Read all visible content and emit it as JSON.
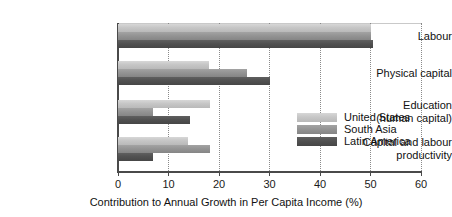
{
  "chart_data": {
    "type": "bar",
    "orientation": "horizontal",
    "title": "",
    "xlabel": "Contribution to Annual Growth in Per Capita Income (%)",
    "ylabel": "",
    "xlim": [
      0,
      60
    ],
    "xticks": [
      0,
      10,
      20,
      30,
      40,
      50,
      60
    ],
    "xtick_labels": [
      "0",
      "10",
      "20",
      "30",
      "40",
      "50",
      "60"
    ],
    "grid": "vertical-dotted",
    "legend_position": "center-right",
    "categories": [
      "Labour",
      "Physical capital",
      "Education\n(human capital)",
      "Capital and labour\nproductivity"
    ],
    "category_lines": [
      [
        "Labour"
      ],
      [
        "Physical capital"
      ],
      [
        "Education",
        "(human capital)"
      ],
      [
        "Capital and labour",
        "productivity"
      ]
    ],
    "series": [
      {
        "name": "United States",
        "color": "#c6c6c6",
        "values": [
          50.0,
          18.0,
          18.3,
          13.8
        ]
      },
      {
        "name": "South Asia",
        "color": "#949494",
        "values": [
          50.0,
          25.5,
          7.0,
          18.2
        ]
      },
      {
        "name": "Latin America",
        "color": "#515151",
        "values": [
          50.5,
          30.0,
          14.2,
          7.0
        ]
      }
    ]
  },
  "legend": {
    "items": [
      {
        "label": "United States",
        "swatch_class": "us"
      },
      {
        "label": "South Asia",
        "swatch_class": "sa"
      },
      {
        "label": "Latin America",
        "swatch_class": "la"
      }
    ]
  },
  "axis": {
    "x_title": "Contribution to Annual Growth in Per Capita Income (%)"
  }
}
